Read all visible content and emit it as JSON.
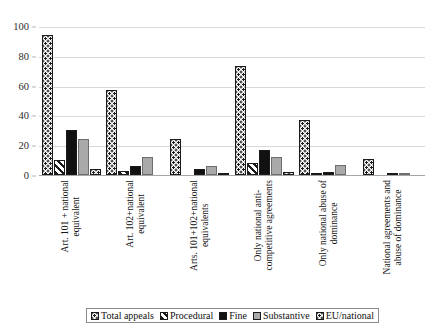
{
  "chart_data": {
    "type": "bar",
    "title": "",
    "subtitle": "",
    "xlabel": "",
    "ylabel": "",
    "ylim": [
      0,
      100
    ],
    "yticks": [
      0,
      20,
      40,
      60,
      80,
      100
    ],
    "grid": true,
    "legend_position": "bottom",
    "categories": [
      "Art. 101 + national\nequivalent",
      "Art. 102+national\nequivalent",
      "Arts. 101+102+national\nequivalents",
      "Only national anti-\ncompetitive agreements",
      "Only national abuse of\ndominance",
      "National agreements and\nabuse of dominance"
    ],
    "series": [
      {
        "name": "Total appeals",
        "pattern": "dotted",
        "values": [
          94,
          57,
          24,
          73,
          37,
          11
        ]
      },
      {
        "name": "Procedural",
        "pattern": "diagonal",
        "values": [
          10,
          3,
          0,
          8,
          1,
          0
        ]
      },
      {
        "name": "Fine",
        "pattern": "solid",
        "values": [
          30,
          6,
          4,
          17,
          2,
          1
        ]
      },
      {
        "name": "Substantive",
        "pattern": "gray",
        "values": [
          24,
          12,
          6,
          12,
          7,
          1
        ]
      },
      {
        "name": "EU/national",
        "pattern": "dotted",
        "values": [
          4,
          0,
          1,
          2,
          0,
          0
        ]
      }
    ],
    "colors": {
      "solid": "#111111",
      "gray": "#a9a9a9",
      "outline": "#1a1a1a",
      "gridline": "#d9d9d9",
      "axis": "#a6a6a6",
      "background": "#ffffff"
    }
  }
}
